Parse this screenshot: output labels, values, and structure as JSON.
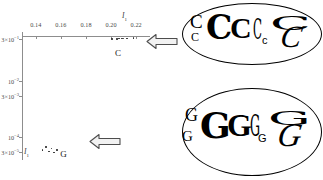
{
  "chart_data": {
    "type": "scatter",
    "title": "",
    "xlabel": "I1",
    "ylabel": "I1",
    "xlabel_display": "I",
    "xlabel_sub": "1",
    "ylabel_display": "I",
    "ylabel_sub": "1",
    "x_ticks": [
      "0.14",
      "0.16",
      "0.18",
      "0.20",
      "0.22"
    ],
    "x_tick_values": [
      0.14,
      0.16,
      0.18,
      0.2,
      0.22
    ],
    "xlim": [
      0.129,
      0.231
    ],
    "y_ticks": [
      {
        "mantissa": "3×10",
        "exp": "−1",
        "value": 0.3
      },
      {
        "mantissa": "10",
        "exp": "−2",
        "value": 0.01
      },
      {
        "mantissa": "3×10",
        "exp": "−3",
        "value": 0.003
      },
      {
        "mantissa": "10",
        "exp": "−4",
        "value": 0.0001
      },
      {
        "mantissa": "3×10",
        "exp": "−5",
        "value": 3e-05
      }
    ],
    "y_scale": "log",
    "grid": false,
    "legend": false,
    "series": [
      {
        "name": "C",
        "label": "C",
        "color": "#2a2a2a",
        "points": [
          {
            "x": 0.2005,
            "y": 0.3
          },
          {
            "x": 0.2045,
            "y": 0.305
          },
          {
            "x": 0.2065,
            "y": 0.312
          },
          {
            "x": 0.2085,
            "y": 0.308
          },
          {
            "x": 0.21,
            "y": 0.316
          },
          {
            "x": 0.2125,
            "y": 0.309
          },
          {
            "x": 0.218,
            "y": 0.318
          }
        ]
      },
      {
        "name": "G",
        "label": "G",
        "color": "#2a2a2a",
        "points": [
          {
            "x": 0.1455,
            "y": 3.5e-05
          },
          {
            "x": 0.148,
            "y": 4.6e-05
          },
          {
            "x": 0.1505,
            "y": 3.1e-05
          },
          {
            "x": 0.1525,
            "y": 4e-05
          },
          {
            "x": 0.1545,
            "y": 2.9e-05
          },
          {
            "x": 0.157,
            "y": 3.6e-05
          }
        ]
      }
    ],
    "annotations": [
      {
        "name": "cluster-label-c",
        "text": "C",
        "x": 0.2055,
        "y_px": 48
      },
      {
        "name": "cluster-label-g",
        "text": "G",
        "x": 0.162,
        "y_px": 149
      }
    ]
  },
  "callouts": [
    {
      "id": "callout-c",
      "letter": "C",
      "arrow": "left-arrow",
      "arrow_direction": "left",
      "glyphs": [
        {
          "char": "C",
          "style": "g-serif",
          "size": 19,
          "x": 8,
          "y": 9,
          "rot": 0
        },
        {
          "char": "C",
          "style": "g-serif",
          "size": 12,
          "x": 9,
          "y": 28,
          "rot": 0
        },
        {
          "char": "C",
          "style": "g-dejavu-b",
          "size": 33,
          "x": 24,
          "y": 8,
          "rot": 0
        },
        {
          "char": "C",
          "style": "g-serif-b",
          "size": 30,
          "x": 48,
          "y": 10,
          "rot": 0
        },
        {
          "char": "C",
          "style": "g-thin",
          "size": 28,
          "x": 71,
          "y": 13,
          "rot": 0
        },
        {
          "char": "c",
          "style": "g-sans",
          "size": 11,
          "x": 80,
          "y": 32,
          "rot": 0
        },
        {
          "char": "C",
          "style": "g-wide",
          "size": 26,
          "x": 88,
          "y": 8,
          "rot": 0
        },
        {
          "char": "C",
          "style": "g-skew",
          "size": 31,
          "x": 99,
          "y": 18,
          "rot": 0
        }
      ]
    },
    {
      "id": "callout-g",
      "letter": "G",
      "arrow": "left-arrow",
      "arrow_direction": "left",
      "glyphs": [
        {
          "char": "G",
          "style": "g-serif",
          "size": 18,
          "x": 3,
          "y": 18,
          "rot": 0
        },
        {
          "char": "G",
          "style": "g-serif",
          "size": 15,
          "x": 0,
          "y": 41,
          "rot": 0
        },
        {
          "char": "G",
          "style": "g-dejavu-b",
          "size": 36,
          "x": 18,
          "y": 19,
          "rot": 0
        },
        {
          "char": "G",
          "style": "g-serif-b",
          "size": 32,
          "x": 45,
          "y": 21,
          "rot": 0
        },
        {
          "char": "G",
          "style": "g-thin",
          "size": 30,
          "x": 68,
          "y": 23,
          "rot": 0
        },
        {
          "char": "G",
          "style": "g-sans",
          "size": 11,
          "x": 76,
          "y": 45,
          "rot": 0
        },
        {
          "char": "G",
          "style": "g-wide",
          "size": 26,
          "x": 86,
          "y": 18,
          "rot": 0
        },
        {
          "char": "G",
          "style": "g-skew",
          "size": 33,
          "x": 96,
          "y": 31,
          "rot": 0
        }
      ]
    }
  ],
  "colors": {
    "axis": "#8d8d8d",
    "tick_text": "#4a4a4a",
    "point": "#2a2a2a",
    "outline": "#000000",
    "arrow_fill": "#f2f2f2",
    "arrow_stroke": "#4d4d4d",
    "background": "#ffffff"
  }
}
